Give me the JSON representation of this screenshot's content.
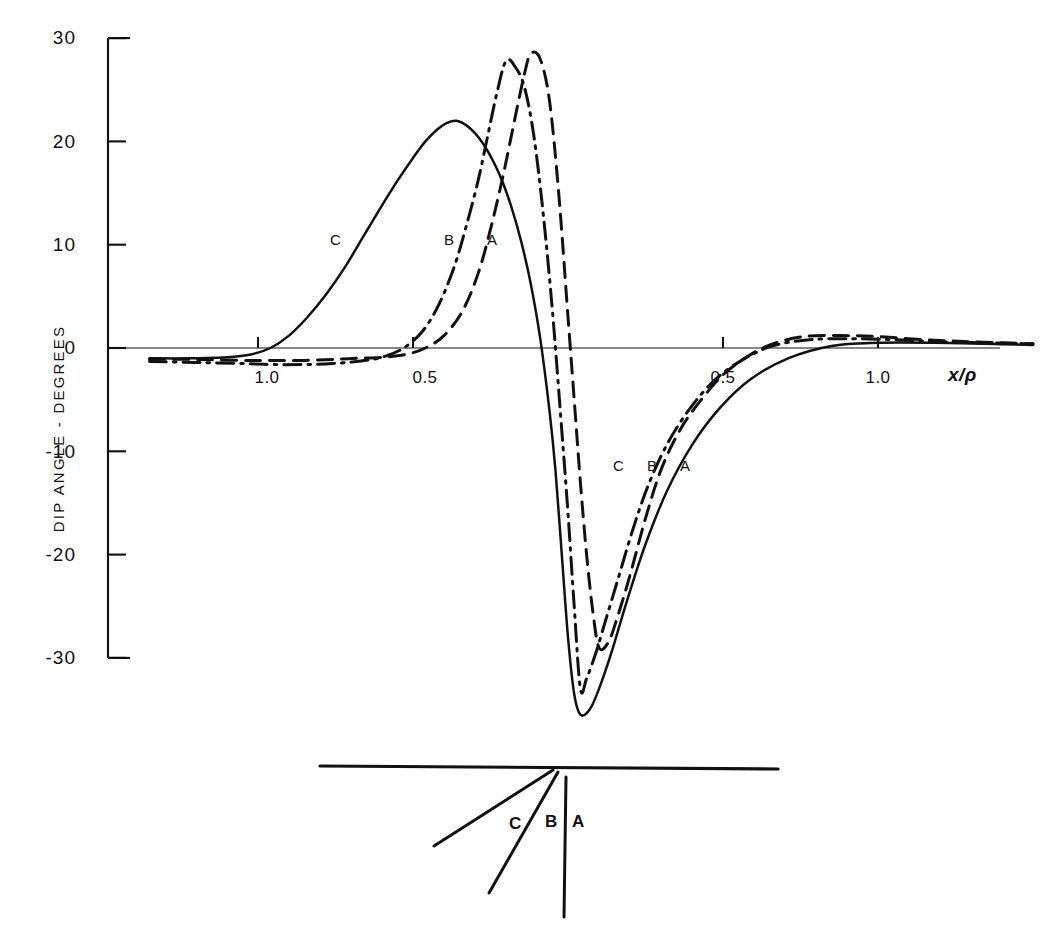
{
  "figure": {
    "background": "#ffffff",
    "ink": "#111111"
  },
  "axes": {
    "y_title": "DIP ANGLE - DEGREES",
    "x_title": "x/ρ",
    "y_ticks": [
      "30",
      "20",
      "10",
      "0",
      "-10",
      "-20",
      "-30"
    ],
    "y_tick_values": [
      30,
      20,
      10,
      0,
      -10,
      -20,
      -30
    ],
    "x_ticks": [
      "1.0",
      "0.5",
      "0.5",
      "1.0"
    ],
    "x_tick_values": [
      -1.0,
      -0.5,
      0.5,
      1.0
    ],
    "x_range": [
      -1.35,
      1.5
    ],
    "y_range": [
      -38,
      31
    ],
    "grid": false
  },
  "curve_labels_upper": [
    {
      "text": "C",
      "x": -0.63,
      "y": 10.5
    },
    {
      "text": "B",
      "x": -0.27,
      "y": 10.5
    },
    {
      "text": "A",
      "x": -0.13,
      "y": 10.5
    }
  ],
  "curve_labels_lower": [
    {
      "text": "C",
      "x": 0.15,
      "y": -12.0
    },
    {
      "text": "B",
      "x": 0.26,
      "y": -12.0
    },
    {
      "text": "A",
      "x": 0.37,
      "y": -12.0
    }
  ],
  "inset": {
    "surface_label": "",
    "sheets": [
      {
        "text": "A",
        "style": "vertical"
      },
      {
        "text": "B",
        "style": "steep-dip"
      },
      {
        "text": "C",
        "style": "shallow-dip"
      }
    ]
  },
  "chart_data": {
    "type": "line",
    "title": "",
    "xlabel": "x/ρ",
    "ylabel": "DIP ANGLE - DEGREES",
    "xlim": [
      -1.35,
      1.5
    ],
    "ylim": [
      -38,
      31
    ],
    "xticks": [
      -1.0,
      -0.5,
      0.5,
      1.0
    ],
    "xticklabels": [
      "1.0",
      "0.5",
      "0.5",
      "1.0"
    ],
    "yticks": [
      30,
      20,
      10,
      0,
      -10,
      -20,
      -30
    ],
    "yticklabels": [
      "30",
      "20",
      "10",
      "0",
      "-10",
      "-20",
      "-30"
    ],
    "grid": false,
    "legend": "inline curve labels A, B, C",
    "series": [
      {
        "name": "A",
        "linestyle": "dashed",
        "color": "#111111",
        "peak": {
          "x": -0.12,
          "y": 28.5
        },
        "trough": {
          "x": 0.1,
          "y": -29.0
        },
        "x": [
          -1.35,
          -1.2,
          -1.05,
          -0.95,
          -0.85,
          -0.75,
          -0.68,
          -0.6,
          -0.52,
          -0.46,
          -0.4,
          -0.34,
          -0.29,
          -0.25,
          -0.21,
          -0.17,
          -0.14,
          -0.12,
          -0.09,
          -0.06,
          -0.03,
          0.0,
          0.02,
          0.04,
          0.06,
          0.08,
          0.1,
          0.13,
          0.16,
          0.2,
          0.25,
          0.3,
          0.36,
          0.43,
          0.5,
          0.58,
          0.66,
          0.76,
          0.88,
          1.0,
          1.15,
          1.3,
          1.5
        ],
        "y": [
          -1.1,
          -1.1,
          -1.2,
          -1.2,
          -1.2,
          -1.1,
          -1.0,
          -0.9,
          -0.6,
          0.0,
          1.2,
          3.6,
          7.2,
          11.5,
          16.6,
          22.4,
          26.6,
          28.5,
          28.0,
          24.0,
          15.0,
          3.0,
          -5.0,
          -13.0,
          -20.0,
          -25.5,
          -29.0,
          -28.5,
          -26.0,
          -22.0,
          -16.5,
          -11.8,
          -8.0,
          -5.0,
          -2.6,
          -0.8,
          0.4,
          1.1,
          1.2,
          1.1,
          0.8,
          0.6,
          0.4
        ]
      },
      {
        "name": "B",
        "linestyle": "dashdot",
        "color": "#111111",
        "peak": {
          "x": -0.2,
          "y": 27.8
        },
        "trough": {
          "x": 0.04,
          "y": -33.0
        },
        "x": [
          -1.35,
          -1.2,
          -1.05,
          -0.95,
          -0.85,
          -0.76,
          -0.68,
          -0.6,
          -0.53,
          -0.47,
          -0.42,
          -0.37,
          -0.33,
          -0.29,
          -0.26,
          -0.23,
          -0.2,
          -0.17,
          -0.14,
          -0.11,
          -0.08,
          -0.05,
          -0.02,
          0.0,
          0.02,
          0.04,
          0.06,
          0.09,
          0.12,
          0.16,
          0.21,
          0.26,
          0.32,
          0.39,
          0.47,
          0.56,
          0.66,
          0.78,
          0.92,
          1.06,
          1.2,
          1.35,
          1.5
        ],
        "y": [
          -1.3,
          -1.4,
          -1.5,
          -1.6,
          -1.6,
          -1.5,
          -1.3,
          -0.9,
          0.0,
          1.6,
          4.0,
          7.6,
          11.6,
          16.2,
          20.4,
          24.6,
          27.8,
          27.2,
          25.2,
          20.5,
          13.0,
          3.5,
          -8.0,
          -16.0,
          -25.0,
          -33.0,
          -32.0,
          -29.5,
          -26.5,
          -22.5,
          -17.5,
          -13.2,
          -9.3,
          -6.0,
          -3.2,
          -1.2,
          0.2,
          0.8,
          0.9,
          0.8,
          0.6,
          0.5,
          0.4
        ]
      },
      {
        "name": "C",
        "linestyle": "solid",
        "color": "#111111",
        "peak": {
          "x": -0.36,
          "y": 22.0
        },
        "trough": {
          "x": 0.0,
          "y": -35.5
        },
        "x": [
          -1.35,
          -1.22,
          -1.1,
          -1.02,
          -0.96,
          -0.9,
          -0.84,
          -0.78,
          -0.72,
          -0.66,
          -0.6,
          -0.55,
          -0.5,
          -0.46,
          -0.42,
          -0.39,
          -0.36,
          -0.33,
          -0.3,
          -0.27,
          -0.24,
          -0.21,
          -0.18,
          -0.15,
          -0.12,
          -0.09,
          -0.06,
          -0.04,
          -0.02,
          0.0,
          0.02,
          0.04,
          0.07,
          0.1,
          0.14,
          0.19,
          0.25,
          0.32,
          0.4,
          0.49,
          0.59,
          0.71,
          0.85,
          1.0,
          1.18,
          1.35,
          1.5
        ],
        "y": [
          -1.0,
          -1.0,
          -0.9,
          -0.6,
          0.0,
          1.2,
          3.0,
          5.2,
          7.8,
          10.8,
          13.8,
          16.2,
          18.4,
          20.0,
          21.2,
          21.8,
          22.0,
          21.6,
          20.8,
          19.6,
          18.0,
          16.0,
          13.4,
          10.2,
          6.2,
          1.0,
          -6.0,
          -12.0,
          -20.0,
          -28.0,
          -33.5,
          -35.5,
          -35.0,
          -33.0,
          -29.5,
          -24.5,
          -19.0,
          -13.8,
          -9.4,
          -5.8,
          -3.0,
          -1.0,
          0.2,
          0.5,
          0.5,
          0.4,
          0.3
        ]
      }
    ]
  }
}
